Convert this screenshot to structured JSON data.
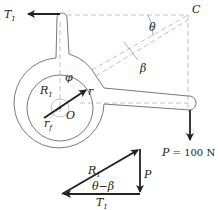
{
  "diagram": {
    "labels": {
      "T1_top": "T",
      "T1_top_sub": "1",
      "C": "C",
      "theta": "θ",
      "beta": "β",
      "phi": "φ",
      "R1": "R",
      "R1_sub": "1",
      "r": "r",
      "rf": "r",
      "rf_sub": "f",
      "O": "O",
      "P_load_var": "P",
      "P_load_value": " = 100 N",
      "tri_R1": "R",
      "tri_R1_sub": "1",
      "tri_P": "P",
      "tri_angle": "θ−β",
      "tri_T1": "T",
      "tri_T1_sub": "1"
    },
    "colors": {
      "line": "#555555",
      "arrow": "#222222",
      "dashed": "#999999"
    }
  }
}
